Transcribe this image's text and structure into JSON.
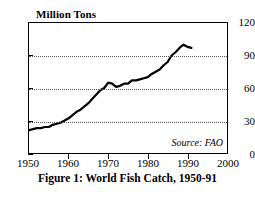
{
  "chart_data": {
    "type": "line",
    "title": "Figure 1: World Fish Catch, 1950-91",
    "ylabel": "Million Tons",
    "xlabel": "",
    "xlim": [
      1950,
      2000
    ],
    "ylim": [
      0,
      120
    ],
    "yticks": [
      0,
      30,
      60,
      90,
      120
    ],
    "xticks": [
      1950,
      1960,
      1970,
      1980,
      1990,
      2000
    ],
    "grid": "horizontal-dotted",
    "legend": "none",
    "annotations": [
      {
        "name": "source",
        "text": "Source: FAO"
      }
    ],
    "series": [
      {
        "name": "World Fish Catch",
        "x": [
          1950,
          1951,
          1952,
          1953,
          1954,
          1955,
          1956,
          1957,
          1958,
          1959,
          1960,
          1961,
          1962,
          1963,
          1964,
          1965,
          1966,
          1967,
          1968,
          1969,
          1970,
          1971,
          1972,
          1973,
          1974,
          1975,
          1976,
          1977,
          1978,
          1979,
          1980,
          1981,
          1982,
          1983,
          1984,
          1985,
          1986,
          1987,
          1988,
          1989,
          1990,
          1991
        ],
        "values": [
          21,
          22,
          23,
          23,
          24,
          24,
          26,
          27,
          28,
          30,
          32,
          35,
          38,
          40,
          43,
          46,
          50,
          54,
          58,
          60,
          65,
          64,
          61,
          62,
          64,
          64,
          67,
          67,
          68,
          69,
          70,
          73,
          75,
          77,
          81,
          84,
          90,
          93,
          97,
          100,
          98,
          97
        ]
      }
    ]
  },
  "labels": {
    "ylabel": "Million Tons",
    "caption": "Figure 1: World Fish Catch, 1950-91",
    "source": "Source: FAO",
    "yticks": [
      "0",
      "30",
      "60",
      "90",
      "120"
    ],
    "xticks": [
      "1950",
      "1960",
      "1970",
      "1980",
      "1990",
      "2000"
    ]
  }
}
